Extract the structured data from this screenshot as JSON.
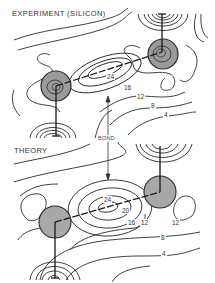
{
  "experiment": {
    "title": "EXPERIMENT (SILICON)",
    "contour_labels": [
      "24",
      "16",
      "12",
      "8",
      "4"
    ]
  },
  "theory": {
    "title": "THEORY",
    "contour_labels": [
      "24",
      "20",
      "16",
      "12",
      "12",
      "8",
      "4"
    ]
  },
  "bond_label": "BOND",
  "colors": {
    "line": "#2a2a2a",
    "atom_fill": "#9a9a9a",
    "background": "#ffffff"
  }
}
